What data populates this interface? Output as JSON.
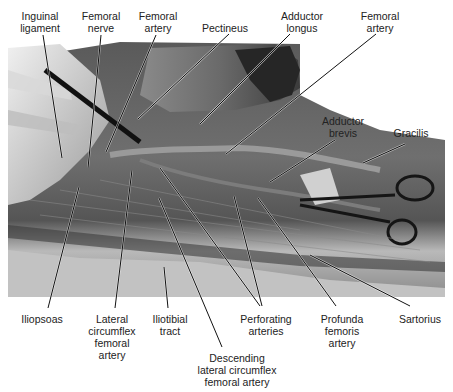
{
  "figure": {
    "labels_top": [
      {
        "id": "inguinal-ligament",
        "lines": [
          "Inguinal",
          "ligament"
        ],
        "x": 40,
        "y": 10
      },
      {
        "id": "femoral-nerve",
        "lines": [
          "Femoral",
          "nerve"
        ],
        "x": 101,
        "y": 10
      },
      {
        "id": "femoral-artery-1",
        "lines": [
          "Femoral",
          "artery"
        ],
        "x": 158,
        "y": 10
      },
      {
        "id": "pectineus",
        "lines": [
          "Pectineus"
        ],
        "x": 225,
        "y": 22
      },
      {
        "id": "adductor-longus",
        "lines": [
          "Adductor",
          "longus"
        ],
        "x": 302,
        "y": 10
      },
      {
        "id": "femoral-artery-2",
        "lines": [
          "Femoral",
          "artery"
        ],
        "x": 380,
        "y": 10
      }
    ],
    "labels_right": [
      {
        "id": "adductor-brevis",
        "lines": [
          "Adductor",
          "brevis"
        ],
        "x": 343,
        "y": 115
      },
      {
        "id": "gracilis",
        "lines": [
          "Gracilis"
        ],
        "x": 411,
        "y": 127
      }
    ],
    "labels_bottom": [
      {
        "id": "iliopsoas",
        "lines": [
          "Iliopsoas"
        ],
        "x": 42,
        "y": 313
      },
      {
        "id": "lateral-circumflex-femoral-artery",
        "lines": [
          "Lateral",
          "circumflex",
          "femoral",
          "artery"
        ],
        "x": 112,
        "y": 313
      },
      {
        "id": "iliotibial-tract",
        "lines": [
          "Iliotibial",
          "tract"
        ],
        "x": 170,
        "y": 313
      },
      {
        "id": "descending-lateral-circumflex-femoral-artery",
        "lines": [
          "Descending",
          "lateral circumflex",
          "femoral artery"
        ],
        "x": 237,
        "y": 352
      },
      {
        "id": "perforating-arteries",
        "lines": [
          "Perforating",
          "arteries"
        ],
        "x": 266,
        "y": 313
      },
      {
        "id": "profunda-femoris-artery",
        "lines": [
          "Profunda",
          "femoris",
          "artery"
        ],
        "x": 342,
        "y": 313
      },
      {
        "id": "sartorius",
        "lines": [
          "Sartorius"
        ],
        "x": 420,
        "y": 313
      }
    ],
    "leader_lines": [
      {
        "label": "inguinal-ligament",
        "x1": 43,
        "y1": 35,
        "x2": 62,
        "y2": 158
      },
      {
        "label": "femoral-nerve",
        "x1": 101,
        "y1": 35,
        "x2": 88,
        "y2": 168
      },
      {
        "label": "femoral-artery-1",
        "x1": 156,
        "y1": 35,
        "x2": 106,
        "y2": 152
      },
      {
        "label": "pectineus",
        "x1": 229,
        "y1": 34,
        "x2": 138,
        "y2": 119
      },
      {
        "label": "adductor-longus",
        "x1": 290,
        "y1": 34,
        "x2": 200,
        "y2": 124
      },
      {
        "label": "femoral-artery-2",
        "x1": 376,
        "y1": 34,
        "x2": 226,
        "y2": 154
      },
      {
        "label": "adductor-brevis",
        "x1": 335,
        "y1": 140,
        "x2": 270,
        "y2": 182
      },
      {
        "label": "gracilis",
        "x1": 405,
        "y1": 144,
        "x2": 363,
        "y2": 163
      },
      {
        "label": "iliopsoas",
        "x1": 48,
        "y1": 308,
        "x2": 79,
        "y2": 187
      },
      {
        "label": "lateral-circumflex-femoral-artery",
        "x1": 115,
        "y1": 308,
        "x2": 132,
        "y2": 170
      },
      {
        "label": "iliotibial-tract",
        "x1": 168,
        "y1": 308,
        "x2": 164,
        "y2": 267
      },
      {
        "label": "descending-lateral-circumflex-femoral-artery",
        "x1": 222,
        "y1": 347,
        "x2": 159,
        "y2": 198
      },
      {
        "label": "perforating-arteries-a",
        "x1": 260,
        "y1": 306,
        "x2": 160,
        "y2": 168
      },
      {
        "label": "perforating-arteries-b",
        "x1": 262,
        "y1": 306,
        "x2": 234,
        "y2": 196
      },
      {
        "label": "profunda-femoris-artery",
        "x1": 336,
        "y1": 306,
        "x2": 258,
        "y2": 198
      },
      {
        "label": "sartorius",
        "x1": 410,
        "y1": 306,
        "x2": 310,
        "y2": 255
      }
    ],
    "colors": {
      "background": "#ffffff",
      "text": "#222222",
      "leader": "#111111",
      "photo_dark": "#2a2a2a",
      "photo_mid": "#6e6e6e",
      "photo_light": "#c8c8c8"
    }
  }
}
